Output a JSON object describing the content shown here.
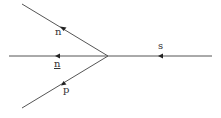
{
  "diagram": {
    "type": "vertex-diagram",
    "line_color": "#555555",
    "label_color": "#333333",
    "vertex": {
      "x": 108,
      "y": 56
    },
    "lines": [
      {
        "id": "upper",
        "from": [
          22,
          4
        ],
        "to": [
          108,
          56
        ],
        "arrow_direction": "toward-left",
        "label": "n"
      },
      {
        "id": "middle-left",
        "from": [
          108,
          56
        ],
        "to": [
          9,
          56
        ],
        "arrow_direction": "toward-left",
        "label": "n̲"
      },
      {
        "id": "lower",
        "from": [
          108,
          56
        ],
        "to": [
          22,
          108
        ],
        "arrow_direction": "toward-left",
        "label": "p"
      },
      {
        "id": "right",
        "from": [
          212,
          56
        ],
        "to": [
          108,
          56
        ],
        "arrow_direction": "toward-left",
        "label": "s"
      }
    ],
    "labels": {
      "upper": "n",
      "middle": "n",
      "lower": "p",
      "right": "s"
    }
  }
}
